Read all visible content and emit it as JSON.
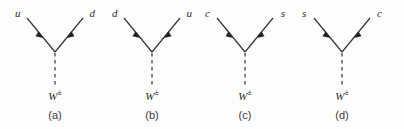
{
  "figure": {
    "background_color": "#fdfdfd",
    "line_color": "#33333a",
    "text_color": "#2b2b2b",
    "caption_color": "#3a3a3a",
    "boson_symbol": "W",
    "boson_superscript": "±",
    "diagrams": [
      {
        "panel": "(a)",
        "left_particle": "u",
        "right_particle": "d",
        "boson": "W",
        "boson_sup": "±",
        "left_arrow_direction": "incoming",
        "right_arrow_direction": "outgoing",
        "propagator_style": "dashed-vertical"
      },
      {
        "panel": "(b)",
        "left_particle": "d",
        "right_particle": "u",
        "boson": "W",
        "boson_sup": "±",
        "left_arrow_direction": "incoming",
        "right_arrow_direction": "outgoing",
        "propagator_style": "dashed-vertical"
      },
      {
        "panel": "(c)",
        "left_particle": "c",
        "right_particle": "s",
        "boson": "W",
        "boson_sup": "±",
        "left_arrow_direction": "incoming",
        "right_arrow_direction": "outgoing",
        "propagator_style": "dashed-vertical"
      },
      {
        "panel": "(d)",
        "left_particle": "s",
        "right_particle": "c",
        "boson": "W",
        "boson_sup": "±",
        "left_arrow_direction": "incoming",
        "right_arrow_direction": "outgoing",
        "propagator_style": "dashed-vertical"
      }
    ]
  }
}
